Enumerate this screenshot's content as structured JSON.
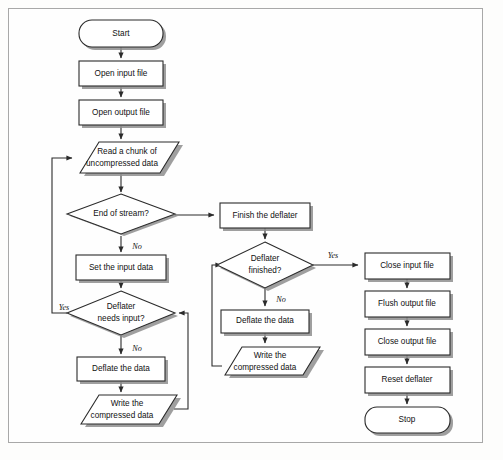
{
  "diagram": {
    "colors": {
      "shape_fill": "#ffffff",
      "shape_stroke": "#2b2b2b",
      "shadow": "#8e8e8e",
      "frame_border": "#a8a8a8",
      "background": "#fefefe"
    },
    "nodes": [
      {
        "id": "start",
        "label": "Start",
        "shape": "terminator",
        "x": 121,
        "y": 33,
        "w": 84,
        "h": 27
      },
      {
        "id": "open_input",
        "label": "Open input file",
        "shape": "process",
        "x": 121,
        "y": 74,
        "w": 84,
        "h": 25
      },
      {
        "id": "open_output",
        "label": "Open output file",
        "shape": "process",
        "x": 121,
        "y": 113,
        "w": 84,
        "h": 25
      },
      {
        "id": "read_chunk",
        "label_line1": "Read a chunk of",
        "label_line2": "uncompressed data",
        "shape": "io",
        "x": 126,
        "y": 158,
        "w": 98,
        "h": 31
      },
      {
        "id": "end_of_stream",
        "label": "End of stream?",
        "shape": "decision",
        "x": 121,
        "y": 215,
        "w": 108,
        "h": 40
      },
      {
        "id": "set_input",
        "label": "Set the input data",
        "shape": "process",
        "x": 121,
        "y": 268,
        "w": 90,
        "h": 25
      },
      {
        "id": "needs_input",
        "label_line1": "Deflater",
        "label_line2": "needs input?",
        "shape": "decision",
        "x": 121,
        "y": 313,
        "w": 108,
        "h": 44
      },
      {
        "id": "deflate_left",
        "label": "Deflate the data",
        "shape": "process",
        "x": 121,
        "y": 369,
        "w": 88,
        "h": 24
      },
      {
        "id": "write_left",
        "label_line1": "Write the",
        "label_line2": "compressed data",
        "shape": "io",
        "x": 126,
        "y": 409,
        "w": 96,
        "h": 30
      },
      {
        "id": "finish_deflater",
        "label": "Finish the deflater",
        "shape": "process",
        "x": 265,
        "y": 215,
        "w": 90,
        "h": 25
      },
      {
        "id": "deflater_done",
        "label_line1": "Deflater",
        "label_line2": "finished?",
        "shape": "decision",
        "x": 265,
        "y": 265,
        "w": 96,
        "h": 46
      },
      {
        "id": "deflate_right",
        "label": "Deflate the data",
        "shape": "process",
        "x": 265,
        "y": 321,
        "w": 88,
        "h": 23
      },
      {
        "id": "write_right",
        "label_line1": "Write the",
        "label_line2": "compressed data",
        "shape": "io",
        "x": 270,
        "y": 360,
        "w": 96,
        "h": 29
      },
      {
        "id": "close_input",
        "label": "Close input file",
        "shape": "process",
        "x": 407,
        "y": 266,
        "w": 85,
        "h": 26
      },
      {
        "id": "flush_output",
        "label": "Flush output file",
        "shape": "process",
        "x": 407,
        "y": 304,
        "w": 85,
        "h": 26
      },
      {
        "id": "close_output",
        "label": "Close output file",
        "shape": "process",
        "x": 407,
        "y": 342,
        "w": 85,
        "h": 26
      },
      {
        "id": "reset_deflater",
        "label": "Reset deflater",
        "shape": "process",
        "x": 407,
        "y": 380,
        "w": 85,
        "h": 26
      },
      {
        "id": "stop",
        "label": "Stop",
        "shape": "terminator",
        "x": 407,
        "y": 420,
        "w": 85,
        "h": 26
      }
    ],
    "edge_labels": [
      {
        "id": "eos_no",
        "text": "No",
        "x": 137,
        "y": 247
      },
      {
        "id": "needs_yes",
        "text": "Yes",
        "x": 64,
        "y": 310
      },
      {
        "id": "needs_no",
        "text": "No",
        "x": 137,
        "y": 349
      },
      {
        "id": "done_yes",
        "text": "Yes",
        "x": 333,
        "y": 256
      },
      {
        "id": "done_no",
        "text": "No",
        "x": 281,
        "y": 301
      }
    ]
  }
}
